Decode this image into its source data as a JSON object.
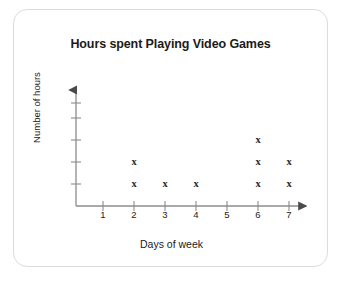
{
  "card": {
    "border_color": "#dcdcdc",
    "background": "#ffffff"
  },
  "chart_data": {
    "type": "scatter",
    "title": "Hours spent Playing Video Games",
    "xlabel": "Days of week",
    "ylabel": "Number of hours",
    "categories": [
      "1",
      "2",
      "3",
      "4",
      "5",
      "6",
      "7"
    ],
    "values": [
      0,
      2,
      1,
      1,
      0,
      3,
      2
    ],
    "marker": "x",
    "marker_color": "#2a2a2a",
    "axis_color": "#8c8c8c",
    "xlim": [
      0,
      8
    ],
    "ylim": [
      0,
      5
    ],
    "y_tick_count": 5,
    "y_tick_labels": [
      "",
      "",
      "",
      "",
      ""
    ],
    "grid": false,
    "legend": false,
    "x_axis_arrow": true,
    "y_axis_arrow": true,
    "note": "Each x mark is one stacked unit above the day tick; counts per day read from stack height."
  }
}
